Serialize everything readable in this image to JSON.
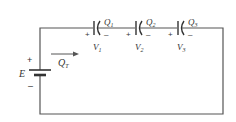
{
  "diagram": {
    "type": "series-capacitor-circuit",
    "source": {
      "label": "E",
      "plus": "+",
      "minus": "–"
    },
    "charge_flow": {
      "label": "Q",
      "subscript": "T"
    },
    "capacitors": [
      {
        "charge_label": "Q",
        "charge_sub": "1",
        "voltage_label": "V",
        "voltage_sub": "1",
        "plus": "+",
        "minus": "–"
      },
      {
        "charge_label": "Q",
        "charge_sub": "2",
        "voltage_label": "V",
        "voltage_sub": "2",
        "plus": "+",
        "minus": "–"
      },
      {
        "charge_label": "Q",
        "charge_sub": "3",
        "voltage_label": "V",
        "voltage_sub": "3",
        "plus": "+",
        "minus": "–"
      }
    ],
    "colors": {
      "wire": "#555555",
      "text": "#333333",
      "background": "#ffffff"
    }
  }
}
